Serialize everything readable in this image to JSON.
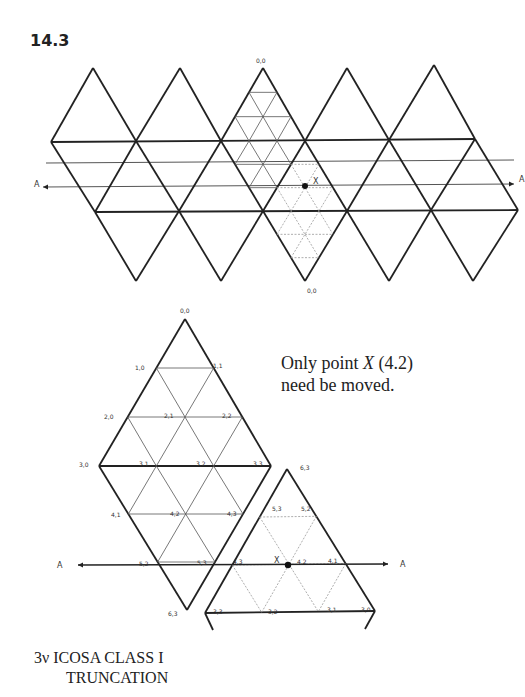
{
  "figure": {
    "number": "14.3",
    "note": {
      "prefix": "Only point ",
      "point": "X",
      "suffix": " (4.2)",
      "line2": "need be moved."
    },
    "caption": {
      "line1": "3ν ICOSA CLASS I",
      "line2": "TRUNCATION"
    }
  },
  "colors": {
    "line": "#222222",
    "thin": "#555555",
    "dotted": "#999999",
    "background": "#ffffff"
  },
  "top_net": {
    "top_apexes": [
      [
        93,
        68
      ],
      [
        180,
        68
      ],
      [
        263,
        68
      ],
      [
        347,
        68
      ],
      [
        434,
        65
      ]
    ],
    "upper_band": [
      [
        51,
        142
      ],
      [
        136,
        141
      ],
      [
        221,
        141
      ],
      [
        305,
        141
      ],
      [
        389,
        140
      ],
      [
        475,
        139
      ]
    ],
    "lower_band": [
      [
        95,
        212
      ],
      [
        179,
        211
      ],
      [
        263,
        211
      ],
      [
        347,
        211
      ],
      [
        431,
        210
      ],
      [
        518,
        210
      ]
    ],
    "bottom_apexes": [
      [
        136,
        281
      ],
      [
        221,
        281
      ],
      [
        305,
        281
      ],
      [
        389,
        281
      ],
      [
        473,
        281
      ]
    ],
    "extra_line": {
      "x1": 46,
      "y1": 163,
      "x2": 514,
      "y2": 160
    },
    "axis_line": {
      "x1": 43,
      "y1": 187,
      "x2": 514,
      "y2": 184
    },
    "axis_labels": [
      {
        "text": "A",
        "x": 34,
        "y": 187
      },
      {
        "text": "A",
        "x": 519,
        "y": 182
      }
    ],
    "apex_label_top": {
      "text": "0,0",
      "x": 256,
      "y": 63
    },
    "apex_label_bottom": {
      "text": "0,0",
      "x": 307,
      "y": 293
    },
    "point_x": {
      "x": 305,
      "y": 186,
      "label": "X",
      "lx": 313,
      "ly": 184
    }
  },
  "bottom_diagram": {
    "diamond": {
      "apex": [
        185,
        319
      ],
      "left": [
        99,
        466
      ],
      "right": [
        271,
        466
      ],
      "bottom": [
        187,
        610
      ]
    },
    "triangle": {
      "apex": [
        287,
        469
      ],
      "bl": [
        205,
        613
      ],
      "br": [
        375,
        611
      ]
    },
    "axis": {
      "x1": 78,
      "y1": 565,
      "x2": 388,
      "y2": 564
    },
    "axis_labels": [
      {
        "text": "A",
        "x": 57,
        "y": 568
      },
      {
        "text": "A",
        "x": 400,
        "y": 567
      }
    ],
    "point_x": {
      "x": 288,
      "y": 565,
      "label": "X",
      "lx": 274,
      "ly": 563
    },
    "vertex_labels": [
      {
        "text": "0,0",
        "x": 180,
        "y": 313
      },
      {
        "text": "1,0",
        "x": 135,
        "y": 370
      },
      {
        "text": "1,1",
        "x": 213,
        "y": 368
      },
      {
        "text": "2,0",
        "x": 104,
        "y": 419
      },
      {
        "text": "2,1",
        "x": 164,
        "y": 418
      },
      {
        "text": "2,2",
        "x": 222,
        "y": 418
      },
      {
        "text": "3,0",
        "x": 79,
        "y": 467
      },
      {
        "text": "3,1",
        "x": 139,
        "y": 466
      },
      {
        "text": "3,2",
        "x": 196,
        "y": 466
      },
      {
        "text": "3,3",
        "x": 253,
        "y": 466
      },
      {
        "text": "4,1",
        "x": 111,
        "y": 517
      },
      {
        "text": "4,2",
        "x": 170,
        "y": 516
      },
      {
        "text": "4,3",
        "x": 227,
        "y": 516
      },
      {
        "text": "5,2",
        "x": 139,
        "y": 566
      },
      {
        "text": "5,3",
        "x": 197,
        "y": 565
      },
      {
        "text": "6,3",
        "x": 168,
        "y": 616
      },
      {
        "text": "6,3",
        "x": 300,
        "y": 470
      },
      {
        "text": "5,3",
        "x": 272,
        "y": 511
      },
      {
        "text": "5,2",
        "x": 301,
        "y": 511
      },
      {
        "text": "4,3",
        "x": 233,
        "y": 564
      },
      {
        "text": "4,2",
        "x": 297,
        "y": 564
      },
      {
        "text": "4,1",
        "x": 328,
        "y": 563
      },
      {
        "text": "3,3",
        "x": 213,
        "y": 614
      },
      {
        "text": "3,2",
        "x": 268,
        "y": 614
      },
      {
        "text": "3,1",
        "x": 327,
        "y": 612
      },
      {
        "text": "3,0",
        "x": 361,
        "y": 612
      }
    ]
  }
}
